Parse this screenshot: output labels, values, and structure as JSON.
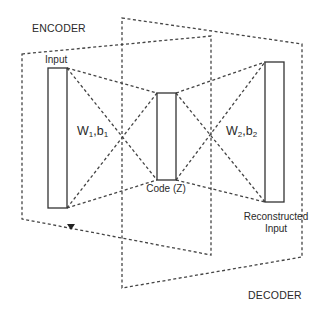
{
  "diagram": {
    "regions": {
      "encoder": {
        "label": "ENCODER",
        "polygon": [
          [
            22,
            54
          ],
          [
            211,
            36
          ],
          [
            211,
            255
          ],
          [
            22,
            219
          ]
        ]
      },
      "decoder": {
        "label": "DECODER",
        "polygon": [
          [
            122,
            18
          ],
          [
            302,
            44
          ],
          [
            302,
            257
          ],
          [
            122,
            288
          ]
        ]
      }
    },
    "layers": {
      "input": {
        "label": "Input",
        "rect": [
          48,
          68,
          19,
          140
        ]
      },
      "code": {
        "label": "Code (Z)",
        "rect": [
          157,
          93,
          19,
          87
        ]
      },
      "output": {
        "label_line1": "Reconstructed",
        "label_line2": "Input",
        "rect": [
          265,
          62,
          19,
          140
        ]
      }
    },
    "weights": {
      "encoder": {
        "w": "W",
        "w_sub": "1",
        "sep": ",",
        "b": "b",
        "b_sub": "1"
      },
      "decoder": {
        "w": "W",
        "w_sub": "2",
        "sep": ",",
        "b": "b",
        "b_sub": "2"
      }
    },
    "colors": {
      "stroke": "#333333",
      "dash": "#444444",
      "background": "#ffffff"
    }
  }
}
